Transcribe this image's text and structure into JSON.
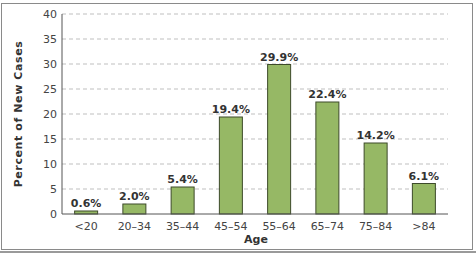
{
  "chart_data": {
    "type": "bar",
    "title": "",
    "xlabel": "Age",
    "ylabel": "Percent of New Cases",
    "categories": [
      "<20",
      "20–34",
      "35–44",
      "45–54",
      "55–64",
      "65–74",
      "75–84",
      ">84"
    ],
    "values": [
      0.6,
      2.0,
      5.4,
      19.4,
      29.9,
      22.4,
      14.2,
      6.1
    ],
    "data_labels": [
      "0.6%",
      "2.0%",
      "5.4%",
      "19.4%",
      "29.9%",
      "22.4%",
      "14.2%",
      "6.1%"
    ],
    "ylim": [
      0,
      40
    ],
    "yticks": [
      0,
      5,
      10,
      15,
      20,
      25,
      30,
      35,
      40
    ],
    "grid": "horizontal dashed",
    "legend": null,
    "colors": {
      "bar_fill": "#96b865",
      "bar_stroke": "#3d4a2a",
      "grid": "#bfbfbf",
      "axis": "#555555",
      "text": "#333333"
    }
  }
}
